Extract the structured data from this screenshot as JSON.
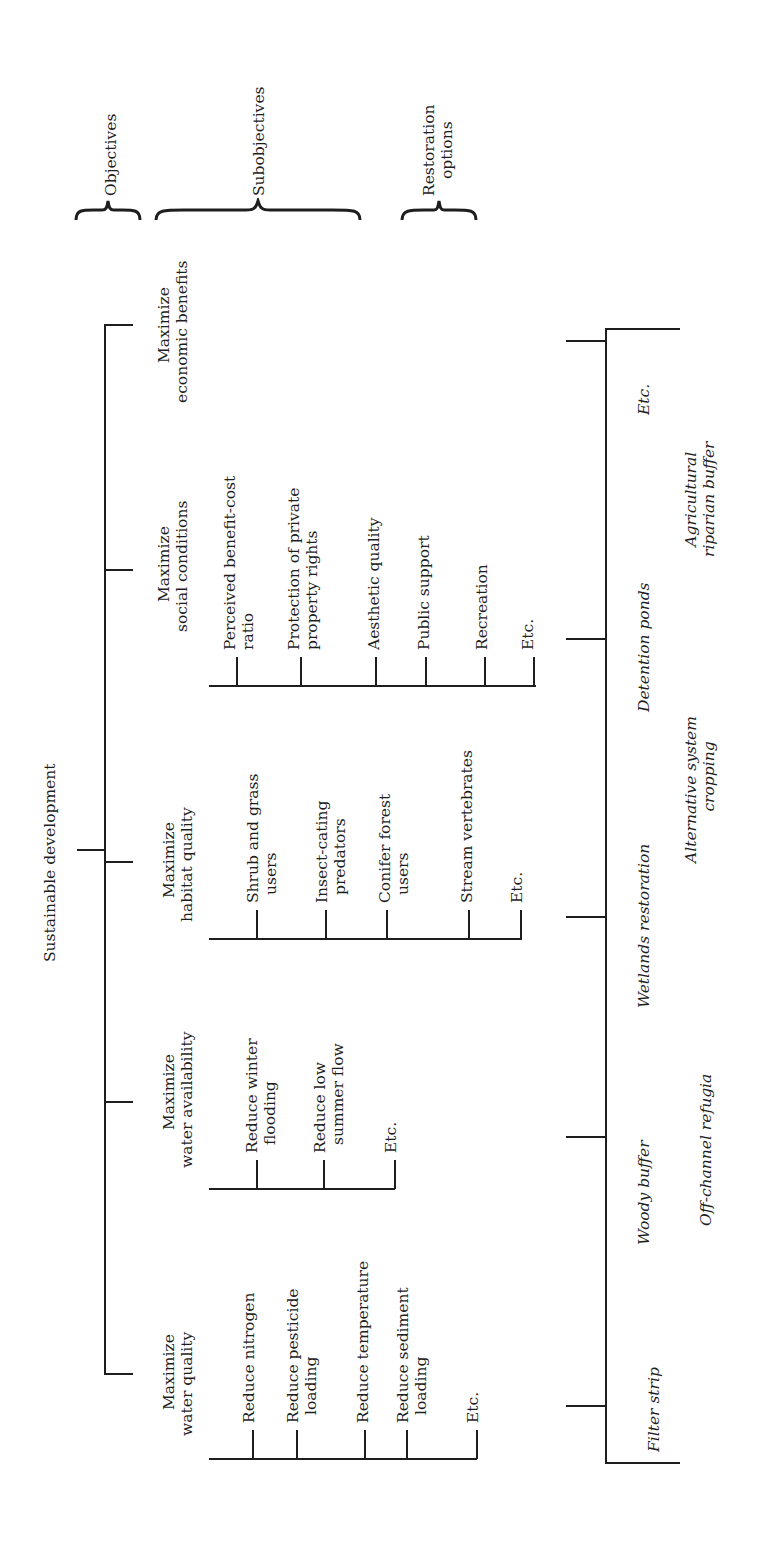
{
  "diagram": {
    "root": "Sustainable development",
    "section_headers": {
      "objectives": "Objectives",
      "subobjectives": "Subobjectives",
      "restoration_options": [
        "Restoration",
        "options"
      ]
    },
    "objectives": [
      {
        "label": [
          "Maximize",
          "economic benefits"
        ],
        "subobjectives": []
      },
      {
        "label": [
          "Maximize",
          "social conditions"
        ],
        "subobjectives": [
          [
            "Perceived benefit-cost",
            "ratio"
          ],
          [
            "Protection of private",
            "property rights"
          ],
          [
            "Aesthetic quality"
          ],
          [
            "Public support"
          ],
          [
            "Recreation"
          ],
          [
            "Etc."
          ]
        ]
      },
      {
        "label": [
          "Maximize",
          "habitat quality"
        ],
        "subobjectives": [
          [
            "Shrub and grass",
            "users"
          ],
          [
            "Insect-cating",
            "predators"
          ],
          [
            "Conifer forest",
            "users"
          ],
          [
            "Stream vertebrates"
          ],
          [
            "Etc."
          ]
        ]
      },
      {
        "label": [
          "Maximize",
          "water availability"
        ],
        "subobjectives": [
          [
            "Reduce winter",
            "flooding"
          ],
          [
            "Reduce low",
            "summer flow"
          ],
          [
            "Etc."
          ]
        ]
      },
      {
        "label": [
          "Maximize",
          "water quality"
        ],
        "subobjectives": [
          [
            "Reduce nitrogen"
          ],
          [
            "Reduce pesticide",
            "loading"
          ],
          [
            "Reduce temperature"
          ],
          [
            "Reduce sediment",
            "loading"
          ],
          [
            "Etc."
          ]
        ]
      }
    ],
    "restoration_options": {
      "row1": [
        "Etc.",
        "Detention ponds",
        "Wetlands restoration",
        "Woody buffer",
        "Filter strip"
      ],
      "row2": [
        [
          "Agricultural",
          "riparian buffer"
        ],
        [
          "Alternative system",
          "cropping"
        ],
        [
          "Off-channel refugia"
        ]
      ]
    }
  }
}
